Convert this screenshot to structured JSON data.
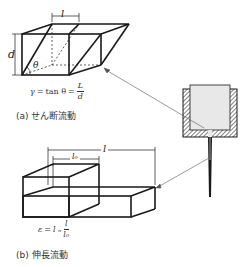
{
  "shear": {
    "width_label": "l",
    "height_label": "d",
    "angle_label": "θ",
    "formula": {
      "lhs": "γ",
      "eq1": "=",
      "mid": "tan θ",
      "eq2": "=",
      "numerator": "L",
      "denominator": "d"
    },
    "caption": "(a)  せん断流動"
  },
  "extension": {
    "length_label": "l",
    "initial_length_label": "l₀",
    "formula": {
      "lhs": "ε",
      "eq": "=",
      "mid": "l ₙ",
      "numerator": "l",
      "denominator": "l₀"
    },
    "caption": "(b)  伸長流動"
  },
  "colors": {
    "line": "#1a1a1a",
    "nozzle_fill": "#e8e8e8",
    "hatch": "#333333"
  }
}
